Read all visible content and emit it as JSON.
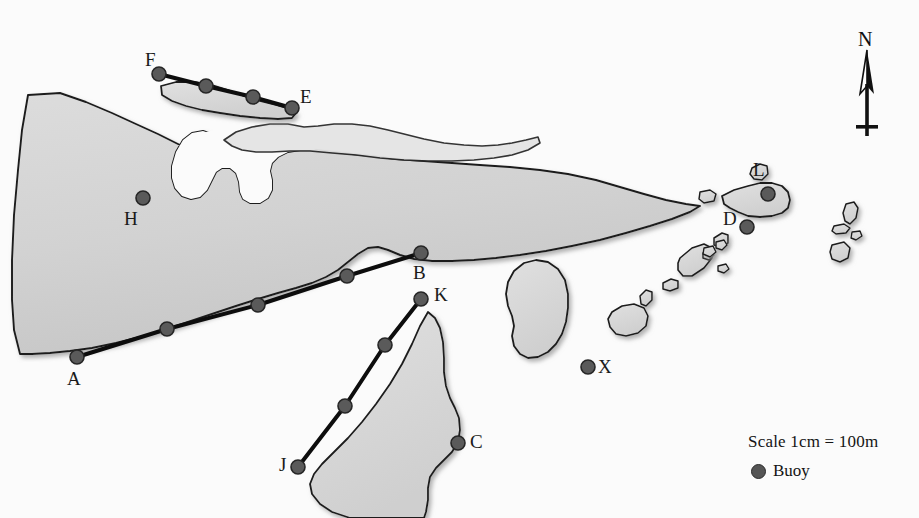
{
  "map": {
    "title": "Coastal buoy survey map",
    "colors": {
      "land_fill": "#d2d2d2",
      "land_stroke": "#1c1c1c",
      "shoal_fill": "#e2e2e2",
      "buoy_fill": "#5a5a5a",
      "buoy_stroke": "#262626",
      "transect_line": "#0d0d0d",
      "background": "#fbfbfb",
      "text": "#141414"
    },
    "buoys": [
      {
        "id": "F",
        "label": "F",
        "x": 159,
        "y": 74,
        "label_x": 145,
        "label_y": 50,
        "labeled": true
      },
      {
        "id": "F2",
        "label": "",
        "x": 206,
        "y": 86,
        "label_x": 0,
        "label_y": 0,
        "labeled": false
      },
      {
        "id": "F3",
        "label": "",
        "x": 253,
        "y": 97,
        "label_x": 0,
        "label_y": 0,
        "labeled": false
      },
      {
        "id": "E",
        "label": "E",
        "x": 292,
        "y": 108,
        "label_x": 300,
        "label_y": 87,
        "labeled": true
      },
      {
        "id": "H",
        "label": "H",
        "x": 143,
        "y": 198,
        "label_x": 124,
        "label_y": 209,
        "labeled": true
      },
      {
        "id": "A",
        "label": "A",
        "x": 77,
        "y": 357,
        "label_x": 67,
        "label_y": 369,
        "labeled": true
      },
      {
        "id": "A2",
        "label": "",
        "x": 167,
        "y": 329,
        "label_x": 0,
        "label_y": 0,
        "labeled": false
      },
      {
        "id": "A3",
        "label": "",
        "x": 258,
        "y": 305,
        "label_x": 0,
        "label_y": 0,
        "labeled": false
      },
      {
        "id": "A4",
        "label": "",
        "x": 347,
        "y": 276,
        "label_x": 0,
        "label_y": 0,
        "labeled": false
      },
      {
        "id": "B",
        "label": "B",
        "x": 421,
        "y": 253,
        "label_x": 413,
        "label_y": 263,
        "labeled": true
      },
      {
        "id": "K",
        "label": "K",
        "x": 421,
        "y": 299,
        "label_x": 434,
        "label_y": 285,
        "labeled": true
      },
      {
        "id": "K2",
        "label": "",
        "x": 385,
        "y": 345,
        "label_x": 0,
        "label_y": 0,
        "labeled": false
      },
      {
        "id": "K3",
        "label": "",
        "x": 345,
        "y": 406,
        "label_x": 0,
        "label_y": 0,
        "labeled": false
      },
      {
        "id": "J",
        "label": "J",
        "x": 298,
        "y": 467,
        "label_x": 279,
        "label_y": 455,
        "labeled": true
      },
      {
        "id": "C",
        "label": "C",
        "x": 458,
        "y": 443,
        "label_x": 470,
        "label_y": 432,
        "labeled": true
      },
      {
        "id": "X",
        "label": "X",
        "x": 588,
        "y": 367,
        "label_x": 598,
        "label_y": 357,
        "labeled": true
      },
      {
        "id": "D",
        "label": "D",
        "x": 747,
        "y": 227,
        "label_x": 723,
        "label_y": 209,
        "labeled": true
      },
      {
        "id": "L",
        "label": "L",
        "x": 768,
        "y": 194,
        "label_x": 753,
        "label_y": 160,
        "labeled": true
      }
    ],
    "transects": [
      {
        "name": "F-E",
        "from": "F",
        "to": "E",
        "points": "159,74 206,86 253,97 292,108"
      },
      {
        "name": "A-B",
        "from": "A",
        "to": "B",
        "points": "77,357 167,329 258,305 347,276 421,253"
      },
      {
        "name": "J-K",
        "from": "J",
        "to": "K",
        "points": "298,467 345,406 385,345 421,299"
      }
    ],
    "legend": {
      "scale_text": "Scale 1cm = 100m",
      "buoy_text": "Buoy",
      "marker_icon": "buoy-dot-icon"
    },
    "north_arrow": {
      "label": "N",
      "icon": "north-arrow-icon"
    }
  }
}
